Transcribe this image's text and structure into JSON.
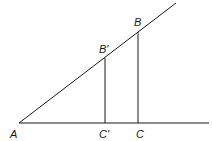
{
  "diagram": {
    "type": "similar-triangles",
    "stroke_color": "#1a1a1a",
    "background": "#ffffff",
    "points": {
      "A": {
        "label": "A",
        "x": 19,
        "y": 123
      },
      "B_prime": {
        "label": "B'",
        "x": 105,
        "y": 58
      },
      "B": {
        "label": "B",
        "x": 138,
        "y": 32
      },
      "C_prime": {
        "label": "C'",
        "x": 105,
        "y": 123
      },
      "C": {
        "label": "C",
        "x": 138,
        "y": 123
      }
    },
    "labels": {
      "A": "A",
      "B_prime": "B'",
      "B": "B",
      "C_prime": "C'",
      "C": "C"
    },
    "lines": [
      {
        "name": "baseline",
        "from": "A",
        "to_x": 209,
        "to_y": 123
      },
      {
        "name": "hypotenuse-ray",
        "from": "A",
        "to_x": 176,
        "to_y": 3
      },
      {
        "name": "segment-b-prime-c-prime",
        "from": "B_prime",
        "to": "C_prime"
      },
      {
        "name": "segment-b-c",
        "from": "B",
        "to": "C"
      }
    ]
  }
}
